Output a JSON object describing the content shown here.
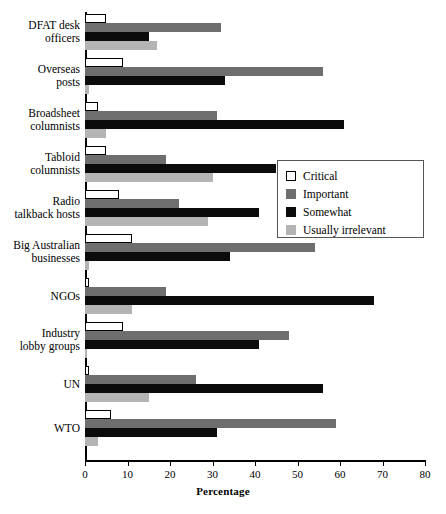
{
  "chart_data": {
    "type": "bar",
    "orientation": "horizontal",
    "title": "",
    "xlabel": "Percentage",
    "ylabel": "",
    "xlim": [
      0,
      80
    ],
    "xticks": [
      0,
      10,
      20,
      30,
      40,
      50,
      60,
      70,
      80
    ],
    "grid": false,
    "legend_position": "center-right",
    "categories": [
      "DFAT desk officers",
      "Overseas posts",
      "Broadsheet columnists",
      "Tabloid columnists",
      "Radio talkback hosts",
      "Big Australian businesses",
      "NGOs",
      "Industry lobby groups",
      "UN",
      "WTO"
    ],
    "category_lines": [
      [
        "DFAT desk",
        "officers"
      ],
      [
        "Overseas",
        "posts"
      ],
      [
        "Broadsheet",
        "columnists"
      ],
      [
        "Tabloid",
        "columnists"
      ],
      [
        "Radio",
        "talkback hosts"
      ],
      [
        "Big Australian",
        "businesses"
      ],
      [
        "NGOs"
      ],
      [
        "Industry",
        "lobby groups"
      ],
      [
        "UN"
      ],
      [
        "WTO"
      ]
    ],
    "series": [
      {
        "name": "Critical",
        "color": "#ffffff",
        "values": [
          5,
          9,
          3,
          5,
          8,
          11,
          1,
          9,
          1,
          6
        ]
      },
      {
        "name": "Important",
        "color": "#6e6e6e",
        "values": [
          32,
          56,
          31,
          19,
          22,
          54,
          19,
          48,
          26,
          59
        ]
      },
      {
        "name": "Somewhat",
        "color": "#0b0b0b",
        "values": [
          15,
          33,
          61,
          45,
          41,
          34,
          68,
          41,
          56,
          31
        ]
      },
      {
        "name": "Usually irrelevant",
        "color": "#b4b4b4",
        "values": [
          17,
          1,
          5,
          30,
          29,
          1,
          11,
          0.5,
          15,
          3
        ]
      }
    ]
  },
  "legend": {
    "items": [
      {
        "label": "Critical",
        "swatch": "critical"
      },
      {
        "label": "Important",
        "swatch": "important"
      },
      {
        "label": "Somewhat",
        "swatch": "somewhat"
      },
      {
        "label": "Usually irrelevant",
        "swatch": "irrelevant"
      }
    ]
  }
}
